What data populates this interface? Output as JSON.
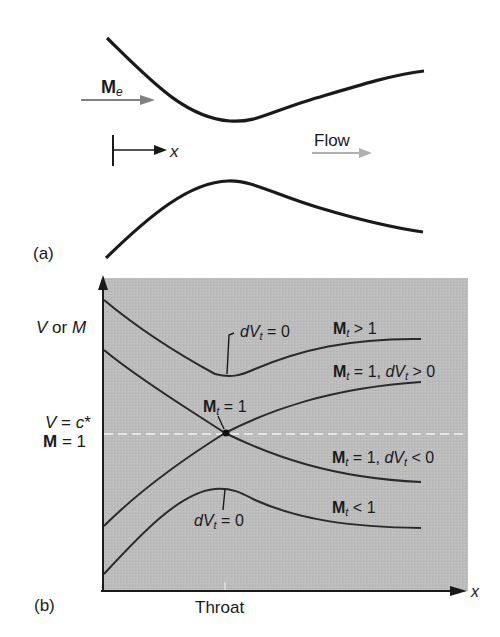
{
  "panel_a": {
    "label": "(a)",
    "inlet_mach_symbol": "M",
    "inlet_mach_subscript": "e",
    "x_axis_symbol": "x",
    "flow_label": "Flow",
    "colors": {
      "wall": "#1a1a1a",
      "arrow_gray": "#808080",
      "flow_arrow": "#b0b0b0"
    }
  },
  "panel_b": {
    "label": "(b)",
    "y_axis_label_prefix": "V",
    "y_axis_label_or": "or",
    "y_axis_label_suffix": "M",
    "reference_line_label_line1": "V = c*",
    "reference_line_label_line2": "M = 1",
    "x_axis_label": "x",
    "throat_label": "Throat",
    "annotations": {
      "top_min": "dVt = 0",
      "sonic_point": "Mt = 1",
      "bottom_max": "dVt = 0"
    },
    "curve_labels": [
      {
        "id": "supersonic",
        "text": "Mt > 1"
      },
      {
        "id": "sonic_accel",
        "text": "Mt = 1, dVt > 0"
      },
      {
        "id": "sonic_decel",
        "text": "Mt = 1, dVt < 0"
      },
      {
        "id": "subsonic",
        "text": "Mt < 1"
      }
    ],
    "colors": {
      "background": "#bdbdbd",
      "curve": "#2a2a2a",
      "dashed_line": "#f2f2f2",
      "axis": "#1a1a1a"
    }
  }
}
